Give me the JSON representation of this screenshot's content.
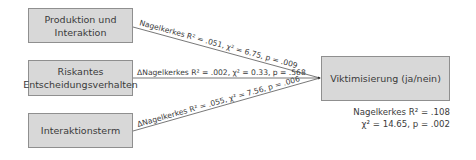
{
  "predictors": [
    {
      "label": "Produktion und\nInteraktion"
    },
    {
      "label": "Riskantes\nEntscheidungsverhalten"
    },
    {
      "label": "Interaktionsterm"
    }
  ],
  "outcome": {
    "label": "Viktimisierung (ja/nein)"
  },
  "edges": [
    {
      "prefix": "",
      "stat": "Nagelkerkes R² = .051, χ² = 6.75, p = .009"
    },
    {
      "prefix": "Δ",
      "stat": "ΔNagelkerkes R² = .002, χ² = 0.33, p = .568"
    },
    {
      "prefix": "Δ",
      "stat": "ΔNagelkerkes R² = .055, χ² = 7.56, p = .006"
    }
  ],
  "model_stats": {
    "line1": "Nagelkerkes R² = .108",
    "line2": "χ² = 14.65, p = .002"
  },
  "colors": {
    "box_fill": "#d8d8d8",
    "box_border": "#8f8f8f",
    "line": "#555555"
  }
}
